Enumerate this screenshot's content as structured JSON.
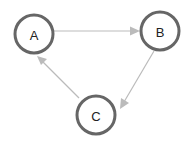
{
  "diagram": {
    "type": "directed-graph",
    "nodes": [
      {
        "id": "A",
        "label": "A",
        "cx": 34,
        "cy": 34,
        "r": 19
      },
      {
        "id": "B",
        "label": "B",
        "cx": 160,
        "cy": 31,
        "r": 19
      },
      {
        "id": "C",
        "label": "C",
        "cx": 96,
        "cy": 115,
        "r": 19
      }
    ],
    "edges": [
      {
        "from": "A",
        "to": "B"
      },
      {
        "from": "B",
        "to": "C"
      },
      {
        "from": "C",
        "to": "A"
      }
    ],
    "colors": {
      "node_stroke": "#666666",
      "edge": "#bbbbbb",
      "label": "#222222"
    }
  }
}
